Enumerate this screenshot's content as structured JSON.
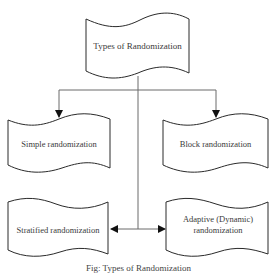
{
  "diagram": {
    "title_node": {
      "label": "Types of Randomization"
    },
    "nodes": [
      {
        "id": "simple",
        "label": "Simple randomization"
      },
      {
        "id": "block",
        "label": "Block randomization"
      },
      {
        "id": "stratified",
        "label": "Stratified randomization"
      },
      {
        "id": "adaptive",
        "label": "Adaptive (Dynamic) randomization"
      }
    ],
    "edges": [
      {
        "from": "Types of Randomization",
        "to": "Simple randomization"
      },
      {
        "from": "Types of Randomization",
        "to": "Block randomization"
      },
      {
        "from": "Types of Randomization",
        "to": "Stratified randomization"
      },
      {
        "from": "Types of Randomization",
        "to": "Adaptive (Dynamic) randomization"
      }
    ],
    "caption": "Fig: Types of Randomization",
    "colors": {
      "stroke": "#2a2a2a",
      "connector": "#6a6a6a",
      "text": "#3a3a3a",
      "background": "#ffffff"
    }
  }
}
